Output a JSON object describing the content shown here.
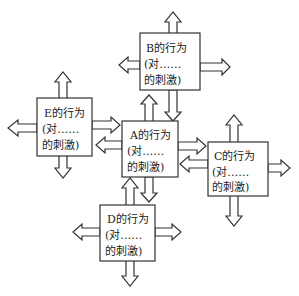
{
  "diagram": {
    "type": "behavior-interaction-network",
    "nodes": [
      {
        "id": "A",
        "line1": "A的行为",
        "line2": "(对……",
        "line3": "的刺激)"
      },
      {
        "id": "B",
        "line1": "B的行为",
        "line2": "(对……",
        "line3": "的刺激)"
      },
      {
        "id": "C",
        "line1": "C的行为",
        "line2": "(对……",
        "line3": "的刺激)"
      },
      {
        "id": "D",
        "line1": "D的行为",
        "line2": "(对……",
        "line3": "的刺激)"
      },
      {
        "id": "E",
        "line1": "E的行为",
        "line2": "(对……",
        "line3": "的刺激)"
      }
    ],
    "edges": [
      {
        "from": "E",
        "to": "A"
      },
      {
        "from": "B",
        "to": "A"
      },
      {
        "from": "A",
        "to": "C"
      },
      {
        "from": "C",
        "to": "A"
      },
      {
        "from": "D",
        "to": "A"
      },
      {
        "from": "A",
        "to": "B"
      },
      {
        "from": "A",
        "to": "E"
      }
    ]
  },
  "colors": {
    "stroke": "#333333",
    "fill": "#ffffff",
    "text": "#222222"
  }
}
